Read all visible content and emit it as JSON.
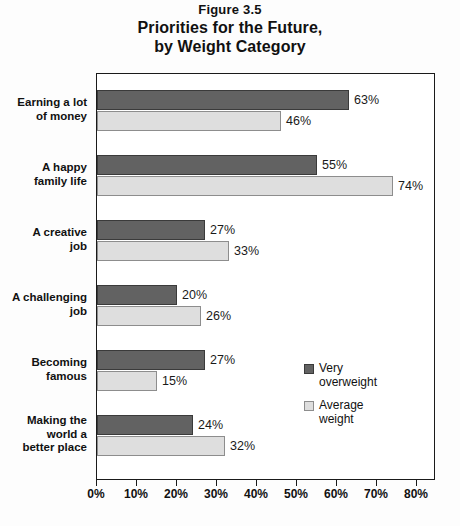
{
  "figure_number": "Figure 3.5",
  "title_lines": [
    "Priorities for the Future,",
    "by Weight Category"
  ],
  "legend": {
    "items": [
      {
        "label": "Very\noverweight",
        "color": "#626262"
      },
      {
        "label": "Average\nweight",
        "color": "#dedede"
      }
    ]
  },
  "chart_data": {
    "type": "bar",
    "orientation": "horizontal",
    "title": "Priorities for the Future, by Weight Category",
    "subtitle": "Figure 3.5",
    "xlabel": "",
    "ylabel": "",
    "xlim": [
      0,
      80
    ],
    "xticks": [
      0,
      10,
      20,
      30,
      40,
      50,
      60,
      70,
      80
    ],
    "xtick_labels": [
      "0%",
      "10%",
      "20%",
      "30%",
      "40%",
      "50%",
      "60%",
      "70%",
      "80%"
    ],
    "grid": false,
    "legend_position": "inside-right",
    "categories": [
      "Earning a lot\nof money",
      "A happy\nfamily life",
      "A creative\njob",
      "A challenging\njob",
      "Becoming\nfamous",
      "Making the\nworld a\nbetter place"
    ],
    "series": [
      {
        "name": "Very overweight",
        "color": "#626262",
        "values": [
          63,
          55,
          27,
          20,
          27,
          24
        ],
        "labels": [
          "63%",
          "55%",
          "27%",
          "20%",
          "27%",
          "24%"
        ]
      },
      {
        "name": "Average weight",
        "color": "#dedede",
        "values": [
          46,
          74,
          33,
          26,
          15,
          32
        ],
        "labels": [
          "46%",
          "74%",
          "33%",
          "26%",
          "15%",
          "32%"
        ]
      }
    ]
  }
}
